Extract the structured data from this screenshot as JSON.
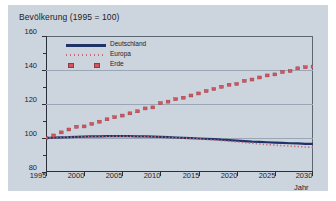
{
  "chart_data": {
    "type": "line",
    "title": "Bevölkerung (1995 = 100)",
    "xlabel": "Jahr",
    "ylabel": "",
    "xlim": [
      1995,
      2030
    ],
    "ylim": [
      80,
      160
    ],
    "grid": true,
    "legend_position": "top-left",
    "xticks": [
      "1995",
      "2000",
      "2005",
      "2010",
      "2015",
      "2020",
      "2025",
      "2030"
    ],
    "yticks": [
      "80",
      "100",
      "120",
      "140",
      "160"
    ],
    "x": [
      1995,
      1996,
      1997,
      1998,
      1999,
      2000,
      2001,
      2002,
      2003,
      2004,
      2005,
      2006,
      2007,
      2008,
      2009,
      2010,
      2011,
      2012,
      2013,
      2014,
      2015,
      2016,
      2017,
      2018,
      2019,
      2020,
      2021,
      2022,
      2023,
      2024,
      2025,
      2026,
      2027,
      2028,
      2029,
      2030
    ],
    "series": [
      {
        "name": "Deutschland",
        "style": "solid-line",
        "color": "#1f3368",
        "values": [
          100.0,
          100.2,
          100.4,
          100.5,
          100.7,
          100.8,
          100.9,
          101.0,
          101.1,
          101.1,
          101.1,
          101.1,
          101.0,
          100.9,
          100.8,
          100.7,
          100.5,
          100.3,
          100.1,
          99.9,
          99.7,
          99.5,
          99.3,
          99.0,
          98.8,
          98.5,
          98.2,
          97.9,
          97.7,
          97.5,
          97.3,
          97.1,
          96.9,
          96.8,
          96.6,
          96.5
        ]
      },
      {
        "name": "Europa",
        "style": "dotted-line",
        "color": "#c86a74",
        "values": [
          100.0,
          100.2,
          100.3,
          100.5,
          100.6,
          100.7,
          100.8,
          100.9,
          100.9,
          101.0,
          101.0,
          101.0,
          100.9,
          100.8,
          100.7,
          100.6,
          100.4,
          100.2,
          100.0,
          99.8,
          99.5,
          99.2,
          98.9,
          98.5,
          98.1,
          97.7,
          97.3,
          96.9,
          96.5,
          96.1,
          95.8,
          95.5,
          95.2,
          95.0,
          94.7,
          94.5
        ]
      },
      {
        "name": "Erde",
        "style": "square-markers",
        "color": "#d2555f",
        "values": [
          100.0,
          101.5,
          103.3,
          105.0,
          106.6,
          106.8,
          108.3,
          109.6,
          111.0,
          112.2,
          113.2,
          114.5,
          115.7,
          117.4,
          118.0,
          120.5,
          121.4,
          122.8,
          123.7,
          125.0,
          126.2,
          127.6,
          128.8,
          130.1,
          131.3,
          131.8,
          133.6,
          134.4,
          135.6,
          136.8,
          137.4,
          138.8,
          139.4,
          141.0,
          141.6,
          142.0
        ]
      }
    ]
  },
  "legend": {
    "items": [
      {
        "label": "Deutschland"
      },
      {
        "label": "Europa"
      },
      {
        "label": "Erde"
      }
    ]
  },
  "colors": {
    "panel_background": "#ccd4de",
    "deutschland": "#1f3368",
    "europa": "#c86a74",
    "erde": "#d2555f",
    "axis": "#2b2f3a",
    "gridline": "#9aa6b5"
  }
}
